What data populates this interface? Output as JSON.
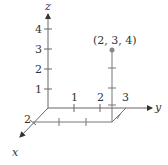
{
  "diagram": {
    "type": "3d-coordinate-point",
    "axes": {
      "x": {
        "label": "x",
        "tick_labels": [
          "2"
        ]
      },
      "y": {
        "label": "y",
        "tick_labels": [
          "1",
          "2",
          "3"
        ]
      },
      "z": {
        "label": "z",
        "tick_labels": [
          "1",
          "2",
          "3",
          "4"
        ]
      }
    },
    "point": {
      "label": "(2, 3, 4)",
      "coords": [
        2,
        3,
        4
      ]
    },
    "colors": {
      "axis": "#555555",
      "point": "#888888",
      "text": "#333333"
    }
  }
}
